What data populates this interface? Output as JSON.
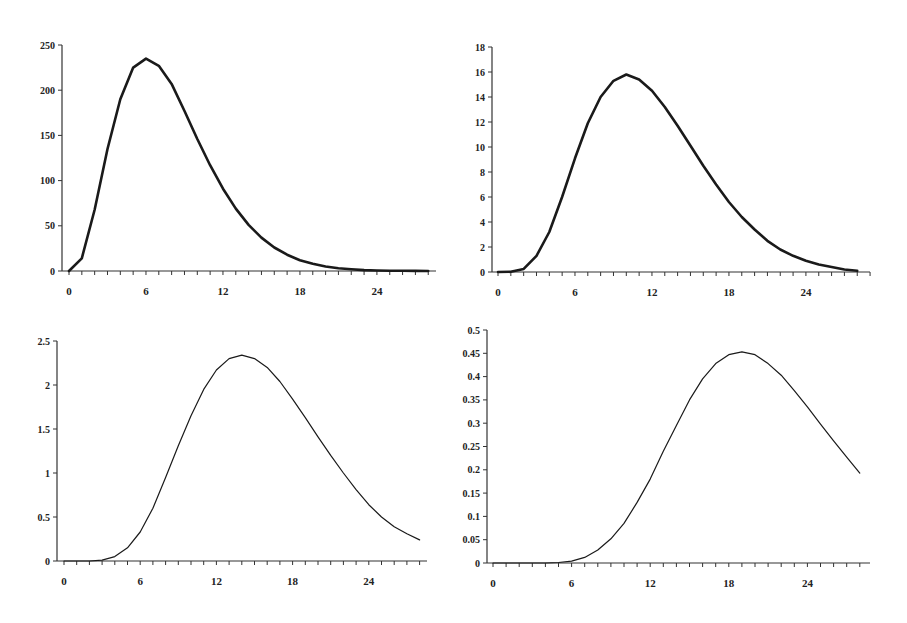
{
  "chart_data": [
    {
      "type": "line",
      "title": "",
      "xlabel": "",
      "ylabel": "",
      "xticks": [
        0,
        6,
        12,
        18,
        24
      ],
      "yticks": [
        0,
        50,
        100,
        150,
        200,
        250
      ],
      "ytick_labels": [
        "0",
        "50",
        "100",
        "150",
        "200",
        "250"
      ],
      "xlim": [
        0,
        28
      ],
      "ylim": [
        0,
        250
      ],
      "grid": false,
      "line_width": 2.6,
      "x": [
        0,
        1,
        2,
        3,
        4,
        5,
        6,
        7,
        8,
        9,
        10,
        11,
        12,
        13,
        14,
        15,
        16,
        17,
        18,
        19,
        20,
        21,
        22,
        23,
        24,
        25,
        26,
        27,
        28
      ],
      "values": [
        0,
        14,
        68,
        135,
        190,
        225,
        235,
        227,
        207,
        177,
        146,
        117,
        91,
        69,
        51,
        37,
        26,
        18,
        12,
        8,
        5,
        3,
        2,
        1,
        0.5,
        0.3,
        0.2,
        0.1,
        0
      ]
    },
    {
      "type": "line",
      "title": "",
      "xlabel": "",
      "ylabel": "",
      "xticks": [
        0,
        6,
        12,
        18,
        24
      ],
      "yticks": [
        0,
        2,
        4,
        6,
        8,
        10,
        12,
        14,
        16,
        18
      ],
      "ytick_labels": [
        "0",
        "2",
        "4",
        "6",
        "8",
        "10",
        "12",
        "14",
        "16",
        "18"
      ],
      "xlim": [
        0,
        28
      ],
      "ylim": [
        0,
        18
      ],
      "grid": false,
      "line_width": 2.6,
      "x": [
        0,
        1,
        2,
        3,
        4,
        5,
        6,
        7,
        8,
        9,
        10,
        11,
        12,
        13,
        14,
        15,
        16,
        17,
        18,
        19,
        20,
        21,
        22,
        23,
        24,
        25,
        26,
        27,
        28
      ],
      "values": [
        0,
        0.02,
        0.25,
        1.3,
        3.2,
        6.0,
        9.1,
        11.9,
        14.0,
        15.3,
        15.8,
        15.4,
        14.5,
        13.2,
        11.7,
        10.1,
        8.5,
        7.0,
        5.6,
        4.4,
        3.4,
        2.5,
        1.8,
        1.3,
        0.9,
        0.6,
        0.4,
        0.2,
        0.1
      ]
    },
    {
      "type": "line",
      "title": "",
      "xlabel": "",
      "ylabel": "",
      "xticks": [
        0,
        6,
        12,
        18,
        24
      ],
      "yticks": [
        0,
        0.5,
        1,
        1.5,
        2,
        2.5
      ],
      "ytick_labels": [
        "0",
        "0.5",
        "1",
        "1.5",
        "2",
        "2.5"
      ],
      "xlim": [
        0,
        28
      ],
      "ylim": [
        0,
        2.5
      ],
      "grid": false,
      "line_width": 1.2,
      "x": [
        0,
        1,
        2,
        3,
        4,
        5,
        6,
        7,
        8,
        9,
        10,
        11,
        12,
        13,
        14,
        15,
        16,
        17,
        18,
        19,
        20,
        21,
        22,
        23,
        24,
        25,
        26,
        27,
        28
      ],
      "values": [
        0,
        0,
        0,
        0.01,
        0.05,
        0.15,
        0.33,
        0.6,
        0.95,
        1.31,
        1.65,
        1.95,
        2.17,
        2.3,
        2.34,
        2.3,
        2.2,
        2.04,
        1.84,
        1.63,
        1.41,
        1.2,
        1.0,
        0.81,
        0.64,
        0.5,
        0.39,
        0.31,
        0.24
      ]
    },
    {
      "type": "line",
      "title": "",
      "xlabel": "",
      "ylabel": "",
      "xticks": [
        0,
        6,
        12,
        18,
        24
      ],
      "yticks": [
        0,
        0.05,
        0.1,
        0.15,
        0.2,
        0.25,
        0.3,
        0.35,
        0.4,
        0.45,
        0.5
      ],
      "ytick_labels": [
        "0",
        "0.05",
        "0.1",
        "0.15",
        "0.2",
        "0.25",
        "0.3",
        "0.35",
        "0.4",
        "0.45",
        "0.5"
      ],
      "xlim": [
        0,
        28
      ],
      "ylim": [
        0,
        0.5
      ],
      "grid": false,
      "line_width": 1.2,
      "x": [
        0,
        1,
        2,
        3,
        4,
        5,
        6,
        7,
        8,
        9,
        10,
        11,
        12,
        13,
        14,
        15,
        16,
        17,
        18,
        19,
        20,
        21,
        22,
        23,
        24,
        25,
        26,
        27,
        28
      ],
      "values": [
        0,
        0,
        0,
        0,
        0,
        0.001,
        0.004,
        0.012,
        0.028,
        0.052,
        0.085,
        0.13,
        0.18,
        0.24,
        0.295,
        0.35,
        0.395,
        0.428,
        0.447,
        0.453,
        0.447,
        0.428,
        0.403,
        0.37,
        0.335,
        0.298,
        0.262,
        0.227,
        0.193
      ]
    }
  ],
  "panels": [
    {
      "left": 20,
      "top": 30,
      "ox": 69,
      "oy": 271,
      "axis_x": 62,
      "px_per_x": 12.83,
      "top_y": 45,
      "x_end": 436
    },
    {
      "left": 450,
      "top": 30,
      "ox": 498,
      "oy": 272,
      "axis_x": 492,
      "px_per_x": 12.83,
      "top_y": 47,
      "x_end": 870
    },
    {
      "left": 20,
      "top": 330,
      "ox": 64,
      "oy": 561,
      "axis_x": 57,
      "px_per_x": 12.7,
      "top_y": 341,
      "x_end": 427
    },
    {
      "left": 450,
      "top": 320,
      "ox": 493,
      "oy": 563,
      "axis_x": 487,
      "px_per_x": 13.1,
      "top_y": 330,
      "x_end": 870
    }
  ],
  "colors": {
    "line": "#1a1a1a",
    "axis": "#333333",
    "text": "#222222"
  }
}
